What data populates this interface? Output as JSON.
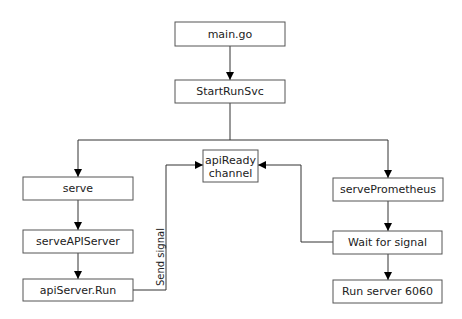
{
  "diagram": {
    "type": "flowchart",
    "nodes": [
      {
        "id": "main",
        "label": "main.go"
      },
      {
        "id": "startRunSvc",
        "label": "StartRunSvc"
      },
      {
        "id": "serve",
        "label": "serve"
      },
      {
        "id": "apiReady",
        "label": "apiReady channel",
        "lines": [
          "apiReady",
          "channel"
        ]
      },
      {
        "id": "servePrometheus",
        "label": "servePrometheus"
      },
      {
        "id": "serveAPIServer",
        "label": "serveAPIServer"
      },
      {
        "id": "waitForSignal",
        "label": "Wait for signal"
      },
      {
        "id": "apiServerRun",
        "label": "apiServer.Run"
      },
      {
        "id": "runServer6060",
        "label": "Run server 6060"
      }
    ],
    "edges": [
      {
        "from": "main",
        "to": "startRunSvc",
        "label": ""
      },
      {
        "from": "startRunSvc",
        "to": "serve",
        "label": ""
      },
      {
        "from": "startRunSvc",
        "to": "servePrometheus",
        "label": ""
      },
      {
        "from": "serve",
        "to": "serveAPIServer",
        "label": ""
      },
      {
        "from": "serveAPIServer",
        "to": "apiServerRun",
        "label": ""
      },
      {
        "from": "apiServerRun",
        "to": "apiReady",
        "label": "Send signal"
      },
      {
        "from": "servePrometheus",
        "to": "waitForSignal",
        "label": ""
      },
      {
        "from": "waitForSignal",
        "to": "apiReady",
        "label": ""
      },
      {
        "from": "waitForSignal",
        "to": "runServer6060",
        "label": ""
      }
    ]
  }
}
